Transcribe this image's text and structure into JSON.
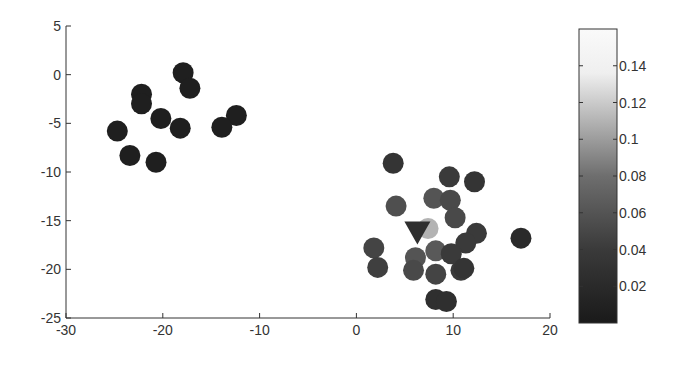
{
  "chart_data": {
    "type": "scatter",
    "title": "",
    "xlabel": "",
    "ylabel": "",
    "xlim": [
      -30,
      20
    ],
    "ylim": [
      -25,
      5
    ],
    "xticks": [
      -30,
      -20,
      -10,
      0,
      10,
      20
    ],
    "yticks": [
      5,
      0,
      -5,
      -10,
      -15,
      -20,
      -25
    ],
    "grid": false,
    "colorbar": {
      "range": [
        0,
        0.16
      ],
      "ticks": [
        0.02,
        0.04,
        0.06,
        0.08,
        0.1,
        0.12,
        0.14
      ],
      "tick_labels": [
        "0.02",
        "0.04",
        "0.06",
        "0.08",
        "0.1",
        "0.12",
        "0.14"
      ],
      "colormap": "gray",
      "position": "right"
    },
    "series": [
      {
        "name": "points",
        "marker": "circle",
        "points": [
          {
            "x": -17.9,
            "y": 0.2,
            "c": 0.005
          },
          {
            "x": -17.2,
            "y": -1.4,
            "c": 0.005
          },
          {
            "x": -22.2,
            "y": -2.0,
            "c": 0.005
          },
          {
            "x": -22.2,
            "y": -3.0,
            "c": 0.005
          },
          {
            "x": -20.2,
            "y": -4.5,
            "c": 0.005
          },
          {
            "x": -18.2,
            "y": -5.5,
            "c": 0.005
          },
          {
            "x": -12.4,
            "y": -4.2,
            "c": 0.005
          },
          {
            "x": -13.9,
            "y": -5.4,
            "c": 0.005
          },
          {
            "x": -24.7,
            "y": -5.8,
            "c": 0.005
          },
          {
            "x": -23.4,
            "y": -8.3,
            "c": 0.005
          },
          {
            "x": -20.7,
            "y": -9.0,
            "c": 0.005
          },
          {
            "x": 3.8,
            "y": -9.1,
            "c": 0.025
          },
          {
            "x": 9.6,
            "y": -10.5,
            "c": 0.03
          },
          {
            "x": 12.2,
            "y": -11.0,
            "c": 0.025
          },
          {
            "x": 4.1,
            "y": -13.5,
            "c": 0.05
          },
          {
            "x": 8.0,
            "y": -12.7,
            "c": 0.055
          },
          {
            "x": 9.7,
            "y": -12.9,
            "c": 0.045
          },
          {
            "x": 10.2,
            "y": -14.7,
            "c": 0.045
          },
          {
            "x": 7.4,
            "y": -15.8,
            "c": 0.11
          },
          {
            "x": 12.4,
            "y": -16.3,
            "c": 0.03
          },
          {
            "x": 11.3,
            "y": -17.3,
            "c": 0.03
          },
          {
            "x": 17.0,
            "y": -16.8,
            "c": 0.015
          },
          {
            "x": 1.8,
            "y": -17.8,
            "c": 0.04
          },
          {
            "x": 2.2,
            "y": -19.8,
            "c": 0.035
          },
          {
            "x": 6.1,
            "y": -18.8,
            "c": 0.055
          },
          {
            "x": 8.2,
            "y": -18.1,
            "c": 0.06
          },
          {
            "x": 5.9,
            "y": -20.1,
            "c": 0.045
          },
          {
            "x": 8.2,
            "y": -20.5,
            "c": 0.04
          },
          {
            "x": 9.8,
            "y": -18.4,
            "c": 0.03
          },
          {
            "x": 10.8,
            "y": -20.1,
            "c": 0.03
          },
          {
            "x": 11.1,
            "y": -19.9,
            "c": 0.025
          },
          {
            "x": 8.2,
            "y": -23.1,
            "c": 0.02
          },
          {
            "x": 9.3,
            "y": -23.3,
            "c": 0.02
          }
        ]
      },
      {
        "name": "query",
        "marker": "triangle-down",
        "points": [
          {
            "x": 6.3,
            "y": -16.0,
            "c": 0.01
          }
        ]
      }
    ]
  }
}
